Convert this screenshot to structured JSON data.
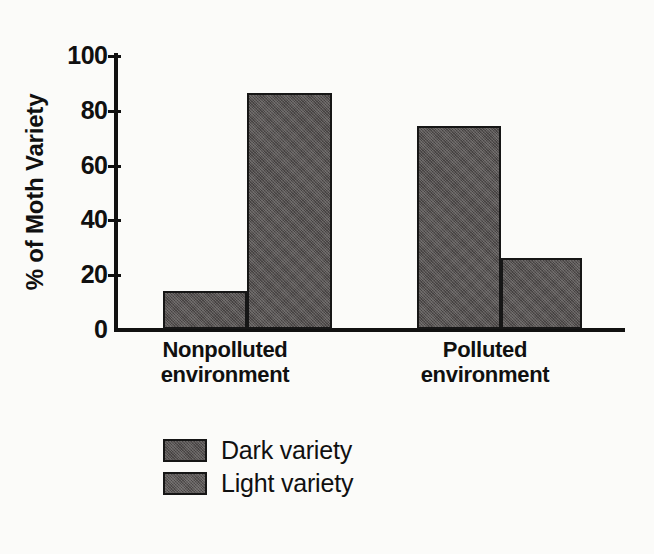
{
  "chart_data": {
    "type": "bar",
    "title": "",
    "xlabel": "",
    "ylabel": "% of Moth Variety",
    "ylim": [
      0,
      100
    ],
    "yticks": [
      0,
      20,
      40,
      60,
      80,
      100
    ],
    "ytick_labels": [
      "0",
      "20",
      "40",
      "60",
      "80",
      "100"
    ],
    "grid": false,
    "legend_position": "bottom-left",
    "categories": [
      "Nonpolluted environment",
      "Polluted environment"
    ],
    "category_lines": [
      {
        "line1": "Nonpolluted",
        "line2": "environment"
      },
      {
        "line1": "Polluted",
        "line2": "environment"
      }
    ],
    "series": [
      {
        "name": "Dark variety",
        "values": [
          14,
          74
        ],
        "color": "#555150"
      },
      {
        "name": "Light variety",
        "values": [
          86,
          26
        ],
        "color": "#5c5857"
      }
    ],
    "bars": [
      {
        "group": "Nonpolluted environment",
        "series": "Dark variety",
        "value": 14
      },
      {
        "group": "Nonpolluted environment",
        "series": "Light variety",
        "value": 86
      },
      {
        "group": "Polluted environment",
        "series": "Dark variety",
        "value": 74
      },
      {
        "group": "Polluted environment",
        "series": "Light variety",
        "value": 26
      }
    ]
  },
  "legend": {
    "items": [
      {
        "label": "Dark variety",
        "swatch": "dark-variety-swatch"
      },
      {
        "label": "Light variety",
        "swatch": "light-variety-swatch"
      }
    ]
  },
  "colors": {
    "background": "#fbfbf9",
    "ink": "#111111",
    "bar_fill": "#555150",
    "bar_outline": "#161616"
  }
}
